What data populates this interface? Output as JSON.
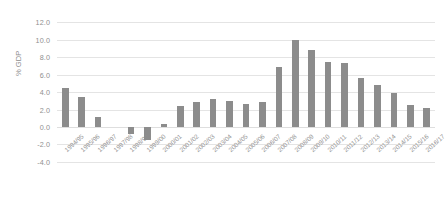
{
  "chart": {
    "type": "bar",
    "ylabel": "% GDP",
    "title": "",
    "xlabel": "",
    "bar_color": "#8c8c8c",
    "gridline_color": "#e4e4e4",
    "axis_text_color": "#8f8f8f",
    "grid": true,
    "legend": "none"
  },
  "chart_data": {
    "type": "bar",
    "title": "",
    "xlabel": "",
    "ylabel": "% GDP",
    "ylim": [
      -4.0,
      12.0
    ],
    "ytick_labels": [
      "12.0",
      "10.0",
      "8.0",
      "6.0",
      "4.0",
      "2.0",
      "0.0",
      "-2.0",
      "-4.0"
    ],
    "ytick_values": [
      12.0,
      10.0,
      8.0,
      6.0,
      4.0,
      2.0,
      0.0,
      -2.0,
      -4.0
    ],
    "grid": true,
    "legend_position": "none",
    "categories": [
      "1994/95",
      "1995/96",
      "1996/97",
      "1997/98",
      "1998/99",
      "1999/00",
      "2000/01",
      "2001/02",
      "2002/03",
      "2003/04",
      "2004/05",
      "2005/06",
      "2006/07",
      "2007/08",
      "2008/09",
      "2009/10",
      "2010/11",
      "2011/12",
      "2012/13",
      "2013/14",
      "2014/15",
      "2015/16",
      "2016/17"
    ],
    "values": [
      4.5,
      3.4,
      1.1,
      0.0,
      -0.8,
      -1.5,
      0.4,
      2.4,
      2.9,
      3.2,
      3.0,
      2.6,
      2.9,
      6.9,
      10.0,
      8.8,
      7.5,
      7.3,
      5.6,
      4.8,
      3.9,
      2.5,
      2.2
    ],
    "series": [
      {
        "name": "% GDP",
        "values": [
          4.5,
          3.4,
          1.1,
          0.0,
          -0.8,
          -1.5,
          0.4,
          2.4,
          2.9,
          3.2,
          3.0,
          2.6,
          2.9,
          6.9,
          10.0,
          8.8,
          7.5,
          7.3,
          5.6,
          4.8,
          3.9,
          2.5,
          2.2
        ]
      }
    ]
  }
}
